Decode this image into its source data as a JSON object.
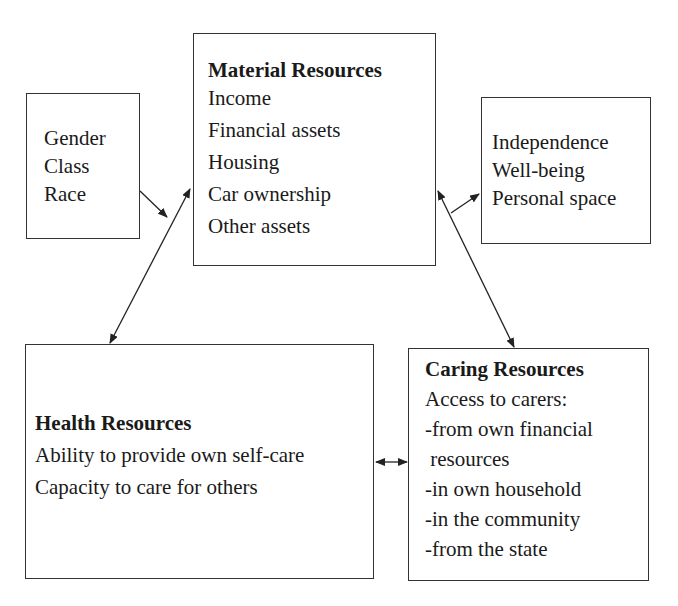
{
  "diagram": {
    "boxes": {
      "factors": {
        "lines": [
          "Gender",
          "Class",
          "Race"
        ]
      },
      "material": {
        "title": "Material Resources",
        "lines": [
          "Income",
          "Financial assets",
          "Housing",
          "Car ownership",
          "Other assets"
        ]
      },
      "outcomes": {
        "lines": [
          "Independence",
          "Well-being",
          "Personal space"
        ]
      },
      "health": {
        "title": "Health Resources",
        "lines": [
          "Ability to provide own self-care",
          "Capacity to care for others"
        ]
      },
      "caring": {
        "title": "Caring Resources",
        "lines": [
          "Access to carers:",
          "-from own financial",
          " resources",
          "-in own household",
          "-in the community",
          "-from the state"
        ]
      }
    },
    "connections": [
      {
        "from": "factors",
        "to": "material",
        "direction": "one-way"
      },
      {
        "from": "material",
        "to": "health",
        "direction": "two-way"
      },
      {
        "from": "material",
        "to": "outcomes",
        "direction": "one-way"
      },
      {
        "from": "material",
        "to": "caring",
        "direction": "two-way"
      },
      {
        "from": "health",
        "to": "caring",
        "direction": "two-way"
      }
    ],
    "colors": {
      "stroke": "#333333",
      "text": "#1a1a1a",
      "background": "#ffffff"
    }
  }
}
